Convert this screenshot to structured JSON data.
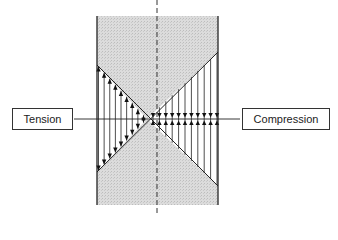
{
  "labels": {
    "tension": "Tension",
    "compression": "Compression"
  },
  "colors": {
    "panel_fill": "#d9d9d9",
    "line": "#222222",
    "background": "#ffffff"
  },
  "geometry": {
    "panel": {
      "x": 97,
      "y": 16,
      "w": 121,
      "h": 189
    },
    "center_dash_x": 157,
    "axis_y": 119,
    "cross_x": 147,
    "left_top_y": 65,
    "left_bottom_y": 172,
    "right_top_y": 52,
    "right_bottom_y": 186,
    "tension_lines": 9,
    "compression_lines": 11
  }
}
